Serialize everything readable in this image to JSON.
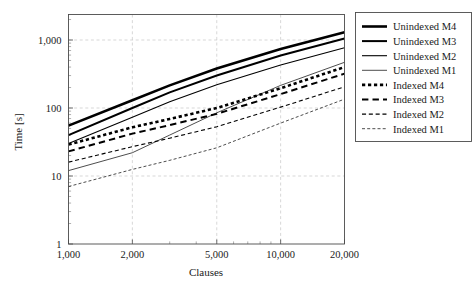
{
  "chart_data": {
    "type": "line",
    "title": "",
    "subtitle": "",
    "xlabel": "Clauses",
    "ylabel": "Time [s]",
    "xscale": "log",
    "yscale": "log",
    "xlim": [
      1000,
      20000
    ],
    "ylim": [
      1,
      2000
    ],
    "grid": true,
    "legend_position": "right-outside",
    "x_ticks": [
      {
        "value": 1000,
        "label": "1,000"
      },
      {
        "value": 2000,
        "label": "2,000"
      },
      {
        "value": 5000,
        "label": "5,000"
      },
      {
        "value": 10000,
        "label": "10,000"
      },
      {
        "value": 20000,
        "label": "20,000"
      }
    ],
    "y_ticks": [
      {
        "value": 1,
        "label": "1"
      },
      {
        "value": 10,
        "label": "10"
      },
      {
        "value": 100,
        "label": "100"
      },
      {
        "value": 1000,
        "label": "1,000"
      }
    ],
    "x": [
      1000,
      2000,
      3000,
      5000,
      10000,
      20000
    ],
    "series": [
      {
        "name": "Unindexed M4",
        "style": "solid",
        "width": 2.6,
        "values": [
          55,
          130,
          215,
          380,
          740,
          1300
        ]
      },
      {
        "name": "Unindexed M3",
        "style": "solid",
        "width": 2.0,
        "values": [
          40,
          100,
          170,
          300,
          590,
          1050
        ]
      },
      {
        "name": "Unindexed M2",
        "style": "solid",
        "width": 1.1,
        "values": [
          30,
          73,
          124,
          220,
          430,
          770
        ]
      },
      {
        "name": "Unindexed M1",
        "style": "solid",
        "width": 0.7,
        "values": [
          12,
          22,
          40,
          85,
          215,
          470
        ]
      },
      {
        "name": "Indexed M4",
        "style": "dotted",
        "width": 2.6,
        "values": [
          29,
          52,
          69,
          100,
          195,
          400
        ]
      },
      {
        "name": "Indexed M3",
        "style": "dashed",
        "width": 2.0,
        "values": [
          23,
          42,
          56,
          82,
          160,
          320
        ]
      },
      {
        "name": "Indexed M2",
        "style": "dashed",
        "width": 1.1,
        "values": [
          16,
          27,
          36,
          53,
          103,
          205
        ]
      },
      {
        "name": "Indexed M1",
        "style": "dashed",
        "width": 0.7,
        "values": [
          7,
          12.5,
          17,
          26,
          60,
          135
        ]
      }
    ],
    "legend": [
      {
        "label": "Unindexed M4",
        "style": "solid",
        "width": 2.6
      },
      {
        "label": "Unindexed M3",
        "style": "solid",
        "width": 2.0
      },
      {
        "label": "Unindexed M2",
        "style": "solid",
        "width": 1.1
      },
      {
        "label": "Unindexed M1",
        "style": "solid",
        "width": 0.7
      },
      {
        "label": "Indexed M4",
        "style": "dotted",
        "width": 2.6
      },
      {
        "label": "Indexed M3",
        "style": "dashed",
        "width": 2.0
      },
      {
        "label": "Indexed M2",
        "style": "dashed",
        "width": 1.1
      },
      {
        "label": "Indexed M1",
        "style": "dashed",
        "width": 0.7
      }
    ],
    "colors": {
      "line": "#000000",
      "grid": "#bdbdbd",
      "frame": "#4a4a4a",
      "text": "#1a1a1a",
      "background": "#ffffff"
    }
  }
}
